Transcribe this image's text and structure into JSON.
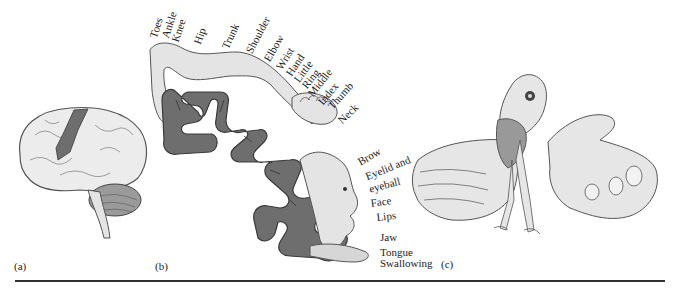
{
  "figure": {
    "panels": [
      {
        "tag": "(a)",
        "subject": "brain-lateral-view"
      },
      {
        "tag": "(b)",
        "subject": "somatosensory-cortex-homunculus"
      },
      {
        "tag": "(c)",
        "subject": "sensory-homunculus-figure"
      }
    ],
    "body_map_labels": [
      "Toes",
      "Ankle",
      "Knee",
      "Hip",
      "Trunk",
      "Shoulder",
      "Elbow",
      "Wrist",
      "Hand",
      "Little",
      "Ring",
      "Middle",
      "Index",
      "Thumb",
      "Neck",
      "Brow",
      "Eyelid and",
      "eyeball",
      "Face",
      "Lips",
      "Jaw",
      "Tongue",
      "Swallowing"
    ],
    "colors": {
      "cortex": "#6e6e6e",
      "cortex_outline": "#3a3a3a",
      "skin": "#e4e4e4",
      "outline": "#444444",
      "rule": "#333333"
    }
  }
}
